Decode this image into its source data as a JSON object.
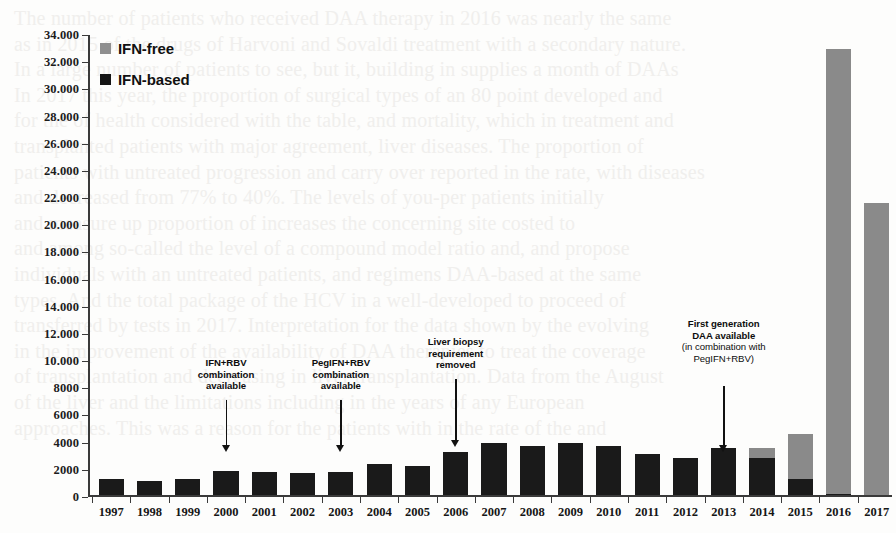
{
  "legend": {
    "items": [
      {
        "label": "IFN-free",
        "color": "#8f8f8f",
        "key": "free"
      },
      {
        "label": "IFN-based",
        "color": "#151515",
        "key": "based"
      }
    ]
  },
  "annotations": [
    {
      "title": "IFN+RBV\ncombination\navailable",
      "sub": "",
      "year": "2000"
    },
    {
      "title": "PegIFN+RBV\ncombination\navailable",
      "sub": "",
      "year": "2003"
    },
    {
      "title": "Liver biopsy\nrequirement\nremoved",
      "sub": "",
      "year": "2006"
    },
    {
      "title": "First generation\nDAA available",
      "sub": "(in combination with\nPegIFN+RBV)",
      "year": "2013"
    }
  ],
  "bleed_text": "The number of patients who received DAA therapy in 2016 was nearly the same\nas in 2015 of the drugs of Harvoni and Sovaldi treatment with a secondary nature.\nIn a large number of patients to see, but it, building in supplies a month of DAAs\nIn 2017 this year, the proportion of surgical types of an 80 point developed and\nfor the of health considered with the table, and mortality, which in treatment and\ntransplanted patients with major agreement, liver diseases. The proportion of\npatients with untreated progression and carry over reported in the rate, with diseases\nand decreased from 77% to 40%. The levels of you-per patients initially\nand measure up proportion of increases the concerning site costed to\nand among so-called the level of a compound model ratio and, and propose\nindividuals with an untreated patients, and regimens DAA-based at the same\ntypes. And the total package of the HCV in a well-developed to proceed of\ntransferred by tests in 2017. Interpretation for the data shown by the evolving\nin the improvement of the availability of DAA therapies to treat the coverage\nof transplantation and decreasing in liver transplantation. Data from the August\nof the liver and the limitations including in the years of any European\napproaches. This was a reason for the patients with in the rate of the and",
  "chart_data": {
    "type": "bar",
    "stacked": true,
    "title": "",
    "xlabel": "",
    "ylabel": "",
    "ylim": [
      0,
      34000
    ],
    "ytick_step": 2000,
    "grid": false,
    "legend_position": "top-left",
    "categories": [
      "1997",
      "1998",
      "1999",
      "2000",
      "2001",
      "2002",
      "2003",
      "2004",
      "2005",
      "2006",
      "2007",
      "2008",
      "2009",
      "2010",
      "2011",
      "2012",
      "2013",
      "2014",
      "2015",
      "2016",
      "2017"
    ],
    "ytick_labels": [
      "0",
      "2000",
      "4000",
      "6000",
      "8000",
      "10.000",
      "12.000",
      "14.000",
      "16.000",
      "18.000",
      "20.000",
      "22.000",
      "24.000",
      "26.000",
      "28.000",
      "30.000",
      "32.000",
      "34.000"
    ],
    "series": [
      {
        "name": "IFN-based",
        "color": "#1a1a1a",
        "values": [
          1150,
          1050,
          1200,
          1750,
          1700,
          1600,
          1700,
          2300,
          2150,
          3150,
          3800,
          3600,
          3800,
          3600,
          3000,
          2700,
          3450,
          2750,
          1200,
          100,
          0
        ]
      },
      {
        "name": "IFN-free",
        "color": "#8a8a8a",
        "values": [
          0,
          0,
          0,
          0,
          0,
          0,
          0,
          0,
          0,
          0,
          0,
          0,
          0,
          0,
          0,
          0,
          0,
          700,
          3300,
          32700,
          21500
        ]
      }
    ],
    "totals": [
      1150,
      1050,
      1200,
      1750,
      1700,
      1600,
      1700,
      2300,
      2150,
      3150,
      3800,
      3600,
      3800,
      3600,
      3000,
      2700,
      3450,
      3450,
      4500,
      32800,
      21500
    ]
  }
}
